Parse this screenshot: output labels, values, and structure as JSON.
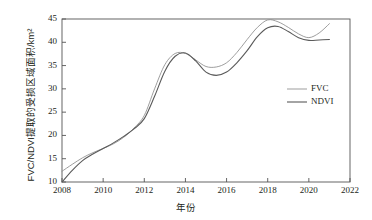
{
  "chart_data": {
    "type": "line",
    "title": "",
    "xlabel": "年份",
    "ylabel": "FVC/NDVI提取的受损区域面积/km²",
    "xlim": [
      2008,
      2022
    ],
    "ylim": [
      10,
      45
    ],
    "xticks": [
      "2008",
      "2010",
      "2012",
      "2014",
      "2016",
      "2018",
      "2020",
      "2022"
    ],
    "yticks": [
      "10",
      "15",
      "20",
      "25",
      "30",
      "35",
      "40",
      "45"
    ],
    "grid": false,
    "legend_position": "center-right",
    "x": [
      2008,
      2008.5,
      2009,
      2009.5,
      2010,
      2010.5,
      2011,
      2011.5,
      2012,
      2012.5,
      2013,
      2013.5,
      2014,
      2014.5,
      2015,
      2015.5,
      2016,
      2016.5,
      2017,
      2017.5,
      2018,
      2018.5,
      2019,
      2019.5,
      2020,
      2020.5,
      2021
    ],
    "series": [
      {
        "name": "FVC",
        "color": "#8c8c8c",
        "values": [
          12.3,
          13.8,
          15.2,
          16.3,
          17.2,
          18.2,
          19.6,
          21.6,
          24.3,
          30.0,
          35.2,
          37.6,
          37.6,
          36.2,
          34.8,
          34.7,
          35.6,
          37.8,
          40.6,
          43.2,
          44.8,
          44.4,
          43.2,
          41.8,
          41.0,
          42.0,
          44.0
        ]
      },
      {
        "name": "NDVI",
        "color": "#5a5a5a",
        "values": [
          10.0,
          12.5,
          14.6,
          16.0,
          17.2,
          18.4,
          19.8,
          21.4,
          23.6,
          28.4,
          33.8,
          37.0,
          37.7,
          36.0,
          33.6,
          32.9,
          33.6,
          35.6,
          38.2,
          41.2,
          43.1,
          43.4,
          42.3,
          41.0,
          40.4,
          40.5,
          40.6
        ]
      }
    ]
  },
  "legend": {
    "items": [
      {
        "label": "FVC"
      },
      {
        "label": "NDVI"
      }
    ]
  },
  "axes": {
    "x_axis_name": "year-axis",
    "y_axis_name": "damaged-area-axis"
  }
}
